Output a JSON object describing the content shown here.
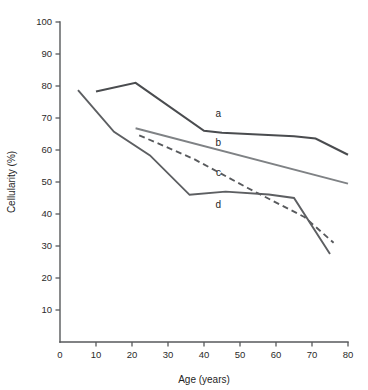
{
  "chart_data": {
    "type": "line",
    "title": "",
    "xlabel": "Age (years)",
    "ylabel": "Cellularity (%)",
    "xlim": [
      0,
      80
    ],
    "ylim": [
      0,
      100
    ],
    "xticks": [
      0,
      10,
      20,
      30,
      40,
      50,
      60,
      70,
      80
    ],
    "yticks": [
      0,
      10,
      20,
      30,
      40,
      50,
      60,
      70,
      80,
      90,
      100
    ],
    "xtick_labels": [
      "0",
      "10",
      "20",
      "30",
      "40",
      "50",
      "60",
      "70",
      "80"
    ],
    "ytick_labels": [
      "0",
      "10",
      "20",
      "30",
      "40",
      "50",
      "60",
      "70",
      "80",
      "90",
      "100"
    ],
    "grid": false,
    "legend_position": "inline-annotations",
    "series": [
      {
        "name": "a",
        "label": "a",
        "style": "solid",
        "color": "#4a4c4f",
        "width": 2.1,
        "label_x": 44,
        "label_y": 71.5,
        "x": [
          10,
          21,
          40,
          45,
          65,
          71,
          80
        ],
        "y": [
          78.3,
          81,
          66,
          65.4,
          64.3,
          63.6,
          58.5
        ]
      },
      {
        "name": "b",
        "label": "b",
        "style": "solid",
        "color": "#7f8285",
        "width": 1.9,
        "label_x": 44,
        "label_y": 62.5,
        "x": [
          21,
          80
        ],
        "y": [
          66.8,
          49.5
        ]
      },
      {
        "name": "c",
        "label": "c",
        "style": "dashed",
        "color": "#585a5d",
        "width": 1.9,
        "dash": "6,4",
        "label_x": 44,
        "label_y": 53,
        "x": [
          22,
          37,
          52,
          68,
          76
        ],
        "y": [
          64.6,
          57.3,
          48.2,
          39,
          31
        ]
      },
      {
        "name": "d",
        "label": "d",
        "style": "solid",
        "color": "#5d5f62",
        "width": 1.9,
        "label_x": 44,
        "label_y": 43,
        "x": [
          5,
          15,
          25,
          36,
          46,
          58,
          65,
          75
        ],
        "y": [
          78.7,
          65.7,
          58.3,
          46,
          47,
          46.1,
          45,
          27.5
        ]
      }
    ]
  }
}
